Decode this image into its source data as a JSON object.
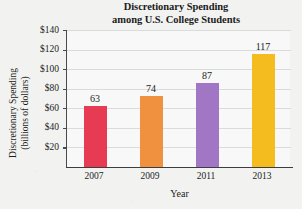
{
  "chart_data": {
    "type": "bar",
    "title": "Discretionary Spending among U.S. College Students",
    "title_line1": "Discretionary Spending",
    "title_line2": "among U.S. College Students",
    "xlabel": "Year",
    "ylabel": "Discretionary Spending (billions of dollars)",
    "ylabel_line1": "Discretionary Spending",
    "ylabel_line2": "(billions of dollars)",
    "categories": [
      "2007",
      "2009",
      "2011",
      "2013"
    ],
    "values": [
      63,
      74,
      87,
      117
    ],
    "value_labels": [
      "63",
      "74",
      "87",
      "117"
    ],
    "ylim": [
      0,
      140
    ],
    "ytick_values": [
      20,
      40,
      60,
      80,
      100,
      120,
      140
    ],
    "ytick_labels": [
      "$20",
      "$40",
      "$60",
      "$80",
      "$100",
      "$120",
      "$140"
    ],
    "grid": true,
    "legend": null,
    "bar_colors": [
      "#e63b52",
      "#f0913f",
      "#a176c4",
      "#f5bc20"
    ],
    "axis_color": "#3d3d3d",
    "gridline_color": "#d8dcdb",
    "plot_background": "#f7f8f7",
    "page_background": "#f2f3f1"
  }
}
